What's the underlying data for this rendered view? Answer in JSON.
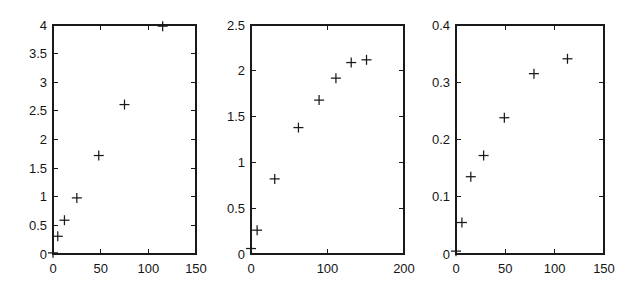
{
  "figure": {
    "title": "",
    "background_color": "#ffffff",
    "foreground_color": "#1a1a1a",
    "panel_count": 3,
    "marker_symbol": "plus",
    "marker_name": "plus-marker"
  },
  "chart_data": [
    {
      "type": "scatter",
      "title": "",
      "xlabel": "",
      "ylabel": "",
      "xlim": [
        0,
        150
      ],
      "ylim": [
        0,
        4
      ],
      "grid": false,
      "legend": null,
      "xticks": [
        0,
        50,
        100,
        150
      ],
      "xticklabels": [
        "0",
        "50",
        "100",
        "150"
      ],
      "yticks": [
        0,
        0.5,
        1,
        1.5,
        2,
        2.5,
        3,
        3.5,
        4
      ],
      "yticklabels": [
        "0",
        "0.5",
        "1",
        "1.5",
        "2",
        "2.5",
        "3",
        "3.5",
        "4"
      ],
      "x": [
        0,
        5,
        12,
        25,
        48,
        75,
        115
      ],
      "y": [
        0.02,
        0.31,
        0.59,
        0.98,
        1.72,
        2.61,
        3.98
      ],
      "marker": "+",
      "color": "#1a1a1a"
    },
    {
      "type": "scatter",
      "title": "",
      "xlabel": "",
      "ylabel": "",
      "xlim": [
        0,
        200
      ],
      "ylim": [
        0,
        2.5
      ],
      "grid": false,
      "legend": null,
      "xticks": [
        0,
        100,
        200
      ],
      "xticklabels": [
        "0",
        "100",
        "200"
      ],
      "yticks": [
        0,
        0.5,
        1,
        1.5,
        2,
        2.5
      ],
      "yticklabels": [
        "0",
        "0.5",
        "1",
        "1.5",
        "2",
        "2.5"
      ],
      "x": [
        0,
        8,
        31,
        62,
        89,
        111,
        131,
        151
      ],
      "y": [
        0.06,
        0.26,
        0.82,
        1.38,
        1.68,
        1.92,
        2.09,
        2.12
      ],
      "marker": "+",
      "color": "#1a1a1a"
    },
    {
      "type": "scatter",
      "title": "",
      "xlabel": "",
      "ylabel": "",
      "xlim": [
        0,
        150
      ],
      "ylim": [
        0,
        0.4
      ],
      "grid": false,
      "legend": null,
      "xticks": [
        0,
        50,
        100,
        150
      ],
      "xticklabels": [
        "0",
        "50",
        "100",
        "150"
      ],
      "yticks": [
        0,
        0.1,
        0.2,
        0.3,
        0.4
      ],
      "yticklabels": [
        "0",
        "0.1",
        "0.2",
        "0.3",
        "0.4"
      ],
      "x": [
        0,
        6,
        15,
        28,
        49,
        79,
        113
      ],
      "y": [
        0.005,
        0.055,
        0.135,
        0.172,
        0.238,
        0.315,
        0.341
      ],
      "marker": "+",
      "color": "#1a1a1a"
    }
  ]
}
